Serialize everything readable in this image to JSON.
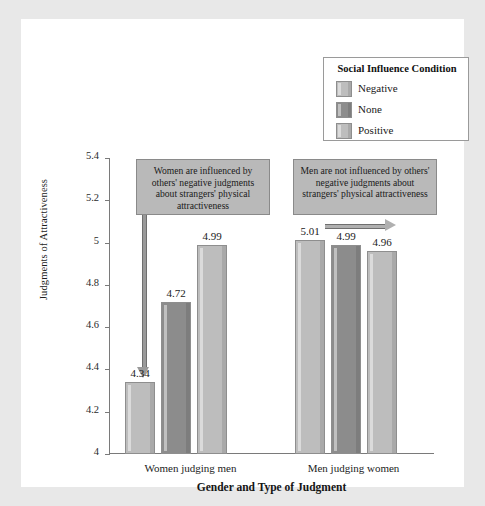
{
  "chart_data": {
    "type": "bar",
    "title": "",
    "xlabel": "Gender and Type of Judgment",
    "ylabel": "Judgments of Attractiveness",
    "ylim": [
      4,
      5.4
    ],
    "yticks": [
      "4",
      "4.2",
      "4.4",
      "4.6",
      "4.8",
      "5",
      "5.2",
      "5.4"
    ],
    "grid": false,
    "legend_position": "top-right",
    "categories": [
      "Women judging men",
      "Men judging women"
    ],
    "series": [
      {
        "name": "Negative",
        "values": [
          4.34,
          5.01
        ],
        "color": "#bdbdbd"
      },
      {
        "name": "None",
        "values": [
          4.72,
          4.99
        ],
        "color": "#8c8c8c"
      },
      {
        "name": "Positive",
        "values": [
          4.99,
          4.96
        ],
        "color": "#bdbdbd"
      }
    ],
    "bar_labels": [
      [
        "4.34",
        "4.72",
        "4.99"
      ],
      [
        "5.01",
        "4.99",
        "4.96"
      ]
    ],
    "annotations": [
      {
        "id": "left-callout",
        "text": "Women are influenced by others' negative judgments about strangers' physical attractiveness",
        "arrow": "down"
      },
      {
        "id": "right-callout",
        "text": "Men are not influenced by others' negative judgments about strangers' physical attractiveness",
        "arrow": "right"
      }
    ]
  },
  "legend": {
    "title": "Social Influence Condition",
    "items": [
      {
        "label": "Negative",
        "color": "#bdbdbd"
      },
      {
        "label": "None",
        "color": "#8c8c8c"
      },
      {
        "label": "Positive",
        "color": "#bdbdbd"
      }
    ]
  },
  "axes": {
    "y_title": "Judgments of Attractiveness",
    "x_title": "Gender and Type of Judgment",
    "y_ticks": [
      "5.4",
      "5.2",
      "5",
      "4.8",
      "4.6",
      "4.4",
      "4.2",
      "4"
    ],
    "x_categories": [
      "Women judging men",
      "Men judging women"
    ]
  },
  "callouts": {
    "left": "Women are influenced by others' negative judgments about strangers' physical attractiveness",
    "right": "Men are not influenced by others' negative judgments about strangers' physical attractiveness"
  },
  "colors": {
    "frame": "#e8e8e8",
    "card": "#ffffff",
    "axis": "#7a7a7a",
    "bar_light": "#bdbdbd",
    "bar_dark": "#8c8c8c",
    "callout_fill": "#b9b9b9",
    "arrow": "#9a9a9a"
  }
}
